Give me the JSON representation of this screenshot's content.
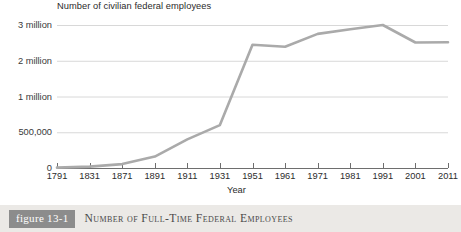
{
  "chart_data": {
    "type": "line",
    "title": "Number of civilian federal employees",
    "xlabel": "Year",
    "ylabel": "",
    "grid": true,
    "legend": null,
    "note": "Y axis is non-linear/broken: 0, 500,000, 1 million, 2 million, 3 million are drawn at equal vertical spacing.",
    "y_ticks": [
      {
        "label": "3 million",
        "value": 3000000
      },
      {
        "label": "2 million",
        "value": 2000000
      },
      {
        "label": "1 million",
        "value": 1000000
      },
      {
        "label": "500,000",
        "value": 500000
      },
      {
        "label": "0",
        "value": 0
      }
    ],
    "categories": [
      "1791",
      "1831",
      "1871",
      "1891",
      "1911",
      "1931",
      "1951",
      "1961",
      "1971",
      "1981",
      "1991",
      "2001",
      "2011"
    ],
    "values": [
      5000,
      20000,
      55000,
      160000,
      400000,
      600000,
      2450000,
      2390000,
      2750000,
      2880000,
      3010000,
      2510000,
      2520000
    ],
    "series": [
      {
        "name": "Number of civilian federal employees",
        "color": "#aaaaaa",
        "values": [
          5000,
          20000,
          55000,
          160000,
          400000,
          600000,
          2450000,
          2390000,
          2750000,
          2880000,
          3010000,
          2510000,
          2520000
        ]
      }
    ],
    "ylim": [
      0,
      3000000
    ]
  },
  "caption": {
    "badge": "figure 13-1",
    "title": "Number of Full-Time Federal Employees"
  },
  "colors": {
    "line": "#aaaaaa",
    "grid": "#d8d8d8",
    "axis": "#6e6e6e",
    "caption_bar": "#ebe9e6",
    "badge_bg": "#8c8c8c",
    "text": "#2b2b2b"
  }
}
